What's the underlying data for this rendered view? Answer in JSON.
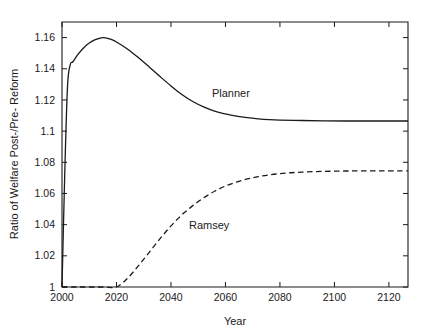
{
  "chart_data": {
    "type": "line",
    "title": "",
    "xlabel": "Year",
    "ylabel": "Ratio of Welfare Post-/Pre- Reform",
    "xlim": [
      2000,
      2127
    ],
    "ylim": [
      1.0,
      1.17
    ],
    "grid": false,
    "legend_position": "inline-annotations",
    "xticks": [
      2000,
      2020,
      2040,
      2060,
      2080,
      2100,
      2120
    ],
    "xtick_labels": [
      "2000",
      "2020",
      "2040",
      "2060",
      "2080",
      "2100",
      "2120"
    ],
    "yticks": [
      1,
      1.02,
      1.04,
      1.06,
      1.08,
      1.1,
      1.12,
      1.14,
      1.16
    ],
    "ytick_labels": [
      "1",
      "1.02",
      "1.04",
      "1.06",
      "1.08",
      "1.1",
      "1.12",
      "1.14",
      "1.16"
    ],
    "annotations": [
      {
        "text": "Planner",
        "x": 2062,
        "y": 1.122
      },
      {
        "text": "Ramsey",
        "x": 2054,
        "y": 1.0375
      }
    ],
    "series": [
      {
        "name": "Planner",
        "style": "solid",
        "color": "#1a1a1a",
        "x": [
          2000,
          2001,
          2002,
          2003,
          2004,
          2006,
          2008,
          2010,
          2012,
          2014,
          2015,
          2016,
          2018,
          2020,
          2024,
          2028,
          2032,
          2036,
          2040,
          2044,
          2048,
          2052,
          2056,
          2060,
          2064,
          2068,
          2072,
          2076,
          2080,
          2088,
          2096,
          2104,
          2112,
          2120,
          2127
        ],
        "y": [
          1.0,
          1.072,
          1.128,
          1.1425,
          1.1445,
          1.1495,
          1.1535,
          1.1565,
          1.1585,
          1.1597,
          1.16,
          1.1598,
          1.1588,
          1.1572,
          1.1527,
          1.1472,
          1.1412,
          1.135,
          1.129,
          1.1235,
          1.119,
          1.1155,
          1.1128,
          1.111,
          1.1096,
          1.1086,
          1.1079,
          1.1074,
          1.1071,
          1.1068,
          1.1066,
          1.1065,
          1.1065,
          1.1065,
          1.1065
        ]
      },
      {
        "name": "Ramsey",
        "style": "dashed",
        "color": "#1a1a1a",
        "x": [
          2000,
          2004,
          2008,
          2012,
          2016,
          2020,
          2024,
          2028,
          2032,
          2036,
          2040,
          2044,
          2048,
          2052,
          2056,
          2060,
          2064,
          2068,
          2072,
          2076,
          2080,
          2084,
          2088,
          2092,
          2096,
          2100,
          2104,
          2108,
          2112,
          2116,
          2120,
          2124,
          2127
        ],
        "y": [
          1.0,
          1.0,
          1.0,
          1.0,
          1.0,
          1.0,
          1.0055,
          1.0135,
          1.0222,
          1.031,
          1.0392,
          1.0463,
          1.0522,
          1.0572,
          1.0614,
          1.0648,
          1.0673,
          1.0693,
          1.0708,
          1.0719,
          1.0727,
          1.0733,
          1.0737,
          1.074,
          1.0742,
          1.0743,
          1.0744,
          1.07445,
          1.0745,
          1.0745,
          1.0745,
          1.0745,
          1.0745
        ]
      }
    ]
  }
}
